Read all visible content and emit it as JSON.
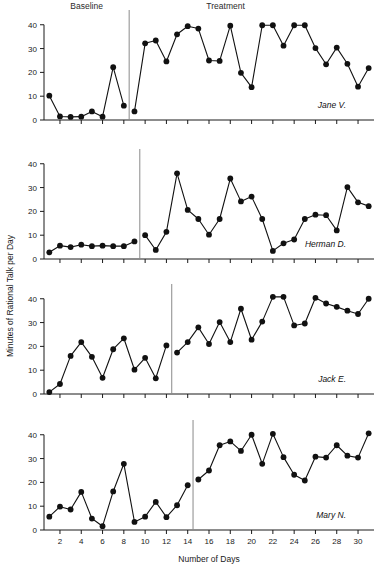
{
  "figure": {
    "width": 383,
    "height": 572,
    "background": "#ffffff",
    "ink_color": "#111111",
    "phase_line_color": "#8a8a8a"
  },
  "labels": {
    "baseline": "Baseline",
    "treatment": "Treatment",
    "xlabel": "Number of Days",
    "ylabel": "Minutes of Rational Talk per Day"
  },
  "chart_data": {
    "type": "line",
    "title": "",
    "subtitle": "",
    "xlabel": "Number of Days",
    "ylabel": "Minutes of Rational Talk per Day",
    "xlim": [
      0.5,
      31.5
    ],
    "ylim": [
      0,
      42
    ],
    "yticks": [
      0,
      10,
      20,
      30,
      40
    ],
    "xticks": [
      2,
      4,
      6,
      8,
      10,
      12,
      14,
      16,
      18,
      20,
      22,
      24,
      26,
      28,
      30
    ],
    "xticklabels": [
      "2",
      "4",
      "6",
      "8",
      "10",
      "12",
      "14",
      "16",
      "18",
      "20",
      "22",
      "24",
      "26",
      "28",
      "30"
    ],
    "grid": false,
    "legend": "none",
    "design": "multiple-baseline-across-subjects",
    "phase_labels": [
      "Baseline",
      "Treatment"
    ],
    "panels": [
      {
        "name": "Jane V.",
        "label": "Jane V.",
        "phase_line_x": 8.5,
        "baseline_days": 8,
        "x": [
          1,
          2,
          3,
          4,
          5,
          6,
          7,
          8,
          9,
          10,
          11,
          12,
          13,
          14,
          15,
          16,
          17,
          18,
          19,
          20,
          21,
          22,
          23,
          24,
          25,
          26,
          27,
          28,
          29,
          30,
          31
        ],
        "values": [
          10.2,
          1.5,
          1.3,
          1.4,
          3.6,
          1.4,
          22.2,
          6.0,
          3.6,
          32.2,
          33.4,
          24.6,
          36.0,
          39.4,
          38.4,
          25.0,
          24.8,
          39.6,
          19.8,
          13.8,
          39.8,
          39.8,
          31.2,
          39.8,
          39.8,
          30.2,
          23.4,
          30.4,
          23.6,
          14.0,
          21.8
        ],
        "treatment_tail_value": 30.4
      },
      {
        "name": "Herman D.",
        "label": "Herman D.",
        "phase_line_x": 9.5,
        "baseline_days": 9,
        "x": [
          1,
          2,
          3,
          4,
          5,
          6,
          7,
          8,
          9,
          10,
          11,
          12,
          13,
          14,
          15,
          16,
          17,
          18,
          19,
          20,
          21,
          22,
          23,
          24,
          25,
          26,
          27,
          28,
          29,
          30,
          31
        ],
        "values": [
          2.8,
          5.6,
          5.0,
          6.0,
          5.4,
          5.6,
          5.4,
          5.4,
          7.4,
          10.0,
          3.8,
          11.4,
          36.0,
          20.6,
          16.8,
          10.2,
          16.8,
          33.8,
          24.2,
          26.2,
          16.8,
          3.4,
          6.6,
          8.2,
          16.8,
          18.6,
          18.4,
          12.0,
          30.2,
          23.8,
          22.2
        ]
      },
      {
        "name": "Jack E.",
        "label": "Jack E.",
        "phase_line_x": 12.5,
        "baseline_days": 12,
        "x": [
          1,
          2,
          3,
          4,
          5,
          6,
          7,
          8,
          9,
          10,
          11,
          12,
          13,
          14,
          15,
          16,
          17,
          18,
          19,
          20,
          21,
          22,
          23,
          24,
          25,
          26,
          27,
          28,
          29,
          30,
          31
        ],
        "values": [
          0.8,
          4.2,
          16.0,
          21.8,
          15.6,
          6.8,
          18.8,
          23.4,
          10.2,
          15.2,
          6.6,
          20.4,
          17.4,
          21.8,
          28.0,
          21.0,
          30.2,
          21.8,
          35.8,
          22.8,
          30.4,
          40.8,
          40.8,
          28.8,
          29.6,
          40.4,
          38.0,
          36.6,
          35.0,
          33.6,
          40.0
        ]
      },
      {
        "name": "Mary N.",
        "label": "Mary N.",
        "phase_line_x": 14.5,
        "baseline_days": 14,
        "x": [
          1,
          2,
          3,
          4,
          5,
          6,
          7,
          8,
          9,
          10,
          11,
          12,
          13,
          14,
          15,
          16,
          17,
          18,
          19,
          20,
          21,
          22,
          23,
          24,
          25,
          26,
          27,
          28,
          29,
          30,
          31
        ],
        "values": [
          5.6,
          9.8,
          8.6,
          16.0,
          4.8,
          1.6,
          16.2,
          27.8,
          3.4,
          5.6,
          11.8,
          5.4,
          10.4,
          18.8,
          21.2,
          25.0,
          35.6,
          37.2,
          33.2,
          40.0,
          27.8,
          40.4,
          30.6,
          23.2,
          20.8,
          30.8,
          30.4,
          35.6,
          31.2,
          30.4,
          40.6
        ]
      }
    ]
  }
}
